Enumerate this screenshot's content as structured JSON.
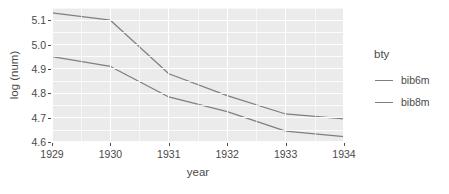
{
  "chart_data": {
    "type": "line",
    "title": "",
    "xlabel": "year",
    "ylabel": "log (num)",
    "x": [
      1929,
      1930,
      1931,
      1932,
      1933,
      1934
    ],
    "xtick_labels": [
      "1929",
      "1930",
      "1931",
      "1932",
      "1933",
      "1934"
    ],
    "ytick_labels": [
      "4.6",
      "4.7",
      "4.8",
      "4.9",
      "5.0",
      "5.1"
    ],
    "ytick_values": [
      4.6,
      4.7,
      4.8,
      4.9,
      5.0,
      5.1
    ],
    "ylim": [
      4.6,
      5.15
    ],
    "xlim": [
      1929,
      1934
    ],
    "grid": true,
    "legend_position": "right",
    "legend_title": "bty",
    "series": [
      {
        "name": "bib6m",
        "color": "#7f7f7f",
        "values": [
          5.13,
          5.1,
          4.88,
          4.79,
          4.715,
          4.695
        ]
      },
      {
        "name": "bib8m",
        "color": "#7f7f7f",
        "values": [
          4.95,
          4.91,
          4.785,
          4.725,
          4.645,
          4.622
        ]
      }
    ]
  },
  "legend": {
    "title": "bty",
    "items": [
      {
        "label": "bib6m"
      },
      {
        "label": "bib8m"
      }
    ]
  },
  "axes": {
    "x_title": "year",
    "y_title": "log (num)"
  },
  "colors": {
    "panel_background": "#ebebeb",
    "grid": "#ffffff",
    "line": "#7f7f7f",
    "text": "#4a4a4a",
    "page_background": "#ffffff"
  }
}
